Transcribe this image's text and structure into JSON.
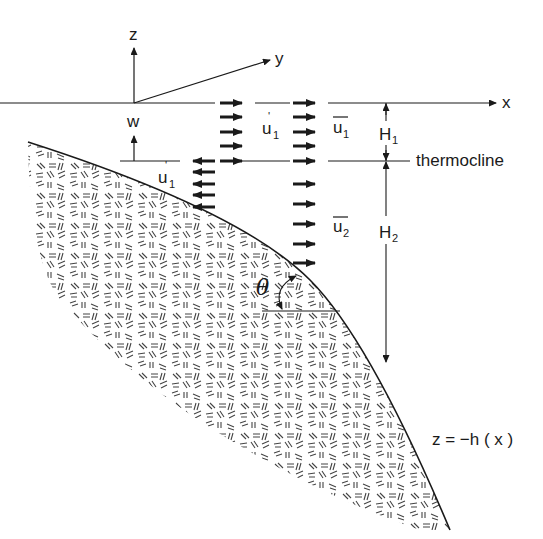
{
  "diagram": {
    "type": "ocean-shelf-slope-cross-section",
    "axes": {
      "z_label": "z",
      "y_label": "y",
      "x_label": "x"
    },
    "labels": {
      "w": "w",
      "u1_prime_upper": "u",
      "u1_prime_upper_sub": "1",
      "u1_prime_upper_sup": "'",
      "u1_prime_lower": "u",
      "u1_prime_lower_sub": "1",
      "u1_prime_lower_sup": "'",
      "u1_bar": "u",
      "u1_bar_sub": "1",
      "u2_bar": "u",
      "u2_bar_sub": "2",
      "H1": "H",
      "H1_sub": "1",
      "H2": "H",
      "H2_sub": "2",
      "thermocline": "thermocline",
      "theta": "θ",
      "bottom": "z = −h ( x )"
    },
    "arrows": {
      "u1_prime_right_count": 5,
      "u1_prime_left_count": 5,
      "u1_bar_right_count": 5,
      "u2_bar_right_count": 5
    },
    "colors": {
      "ink": "#1a1a1a",
      "background": "#ffffff",
      "sediment_hatch": "#444444"
    }
  }
}
